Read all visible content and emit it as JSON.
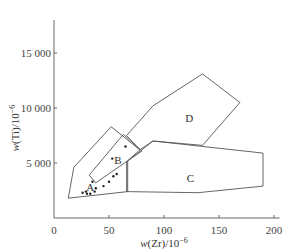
{
  "chart_data": {
    "type": "scatter",
    "title": "",
    "xlabel": "w(Zr)/10^-6",
    "ylabel": "w(Ti)/10^-6",
    "xlim": [
      0,
      205
    ],
    "ylim": [
      0,
      18000
    ],
    "grid": false,
    "x_ticks": [
      0,
      50,
      100,
      150,
      200
    ],
    "x_tick_labels": [
      "0",
      "50",
      "100",
      "150",
      "200"
    ],
    "y_ticks": [
      5000,
      10000,
      15000
    ],
    "y_tick_labels": [
      "5 000",
      "10 000",
      "15 000"
    ],
    "regions": [
      {
        "name": "A",
        "label_at": [
          33,
          2800
        ],
        "polygon": [
          [
            13,
            1800
          ],
          [
            18,
            4600
          ],
          [
            52,
            8300
          ],
          [
            78,
            6200
          ],
          [
            67,
            5200
          ],
          [
            67,
            2400
          ]
        ]
      },
      {
        "name": "B",
        "label_at": [
          58,
          5300
        ],
        "polygon": [
          [
            32,
            3900
          ],
          [
            38,
            3200
          ],
          [
            80,
            6100
          ],
          [
            63,
            7600
          ]
        ]
      },
      {
        "name": "C",
        "label_at": [
          124,
          3600
        ],
        "polygon": [
          [
            90,
            7000
          ],
          [
            190,
            5900
          ],
          [
            190,
            2900
          ],
          [
            131,
            2300
          ],
          [
            66,
            2400
          ],
          [
            66,
            5100
          ]
        ]
      },
      {
        "name": "D",
        "label_at": [
          123,
          9100
        ],
        "polygon": [
          [
            66,
            7500
          ],
          [
            90,
            10200
          ],
          [
            135,
            13100
          ],
          [
            169,
            10500
          ],
          [
            135,
            6600
          ],
          [
            90,
            7000
          ],
          [
            78,
            6200
          ]
        ]
      }
    ],
    "points": [
      {
        "x": 26,
        "y": 2300
      },
      {
        "x": 29,
        "y": 2400
      },
      {
        "x": 30,
        "y": 2200
      },
      {
        "x": 33,
        "y": 2200
      },
      {
        "x": 37,
        "y": 2400
      },
      {
        "x": 38,
        "y": 2700
      },
      {
        "x": 35,
        "y": 3300
      },
      {
        "x": 45,
        "y": 2900
      },
      {
        "x": 50,
        "y": 3300
      },
      {
        "x": 54,
        "y": 3800
      },
      {
        "x": 57,
        "y": 4000
      },
      {
        "x": 53,
        "y": 5400
      },
      {
        "x": 65,
        "y": 6500
      }
    ]
  }
}
